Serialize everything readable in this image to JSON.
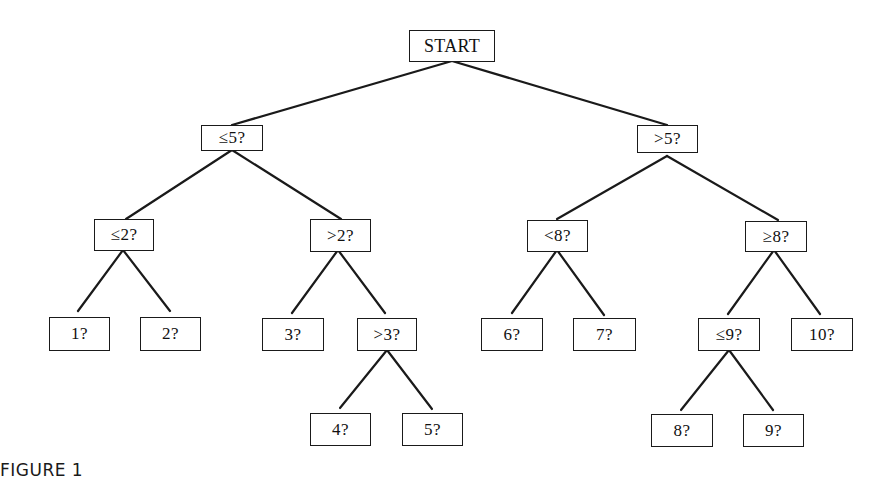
{
  "diagram": {
    "type": "binary-decision-tree",
    "caption": "FIGURE 1",
    "nodes": {
      "start": "START",
      "le5": "≤5?",
      "gt5": ">5?",
      "le2": "≤2?",
      "gt2": ">2?",
      "lt8": "<8?",
      "ge8": "≥8?",
      "n1": "1?",
      "n2": "2?",
      "n3": "3?",
      "gt3": ">3?",
      "n6": "6?",
      "n7": "7?",
      "le9": "≤9?",
      "n10": "10?",
      "n4": "4?",
      "n5": "5?",
      "n8": "8?",
      "n9": "9?"
    },
    "edges": [
      [
        "start",
        "le5"
      ],
      [
        "start",
        "gt5"
      ],
      [
        "le5",
        "le2"
      ],
      [
        "le5",
        "gt2"
      ],
      [
        "gt5",
        "lt8"
      ],
      [
        "gt5",
        "ge8"
      ],
      [
        "le2",
        "n1"
      ],
      [
        "le2",
        "n2"
      ],
      [
        "gt2",
        "n3"
      ],
      [
        "gt2",
        "gt3"
      ],
      [
        "gt3",
        "n4"
      ],
      [
        "gt3",
        "n5"
      ],
      [
        "lt8",
        "n6"
      ],
      [
        "lt8",
        "n7"
      ],
      [
        "ge8",
        "le9"
      ],
      [
        "ge8",
        "n10"
      ],
      [
        "le9",
        "n8"
      ],
      [
        "le9",
        "n9"
      ]
    ],
    "colors": {
      "line": "#1a1a1a",
      "background": "#ffffff",
      "text": "#111111"
    }
  }
}
